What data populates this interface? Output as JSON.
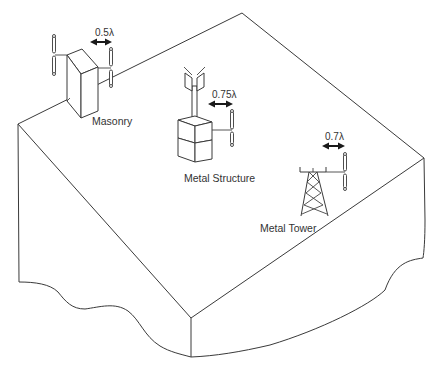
{
  "figure": {
    "background": "#ffffff",
    "line_color": "#3a3a3a"
  },
  "mounts": [
    {
      "id": "masonry",
      "label": "Masonry",
      "spacing": "0.5λ"
    },
    {
      "id": "metal-structure",
      "label": "Metal Structure",
      "spacing": "0.75λ"
    },
    {
      "id": "metal-tower",
      "label": "Metal Tower",
      "spacing": "0.7λ"
    }
  ],
  "icons": {
    "dimension_arrow": "double-headed-arrow",
    "antenna": "dipole-antenna",
    "panel_antenna": "panel-antenna"
  }
}
